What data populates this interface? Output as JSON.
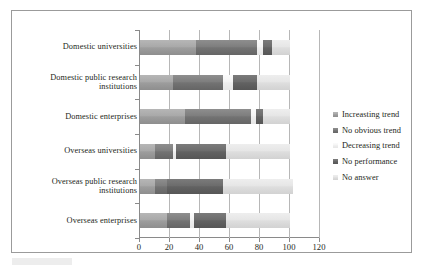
{
  "chart_data": {
    "type": "bar",
    "orientation": "horizontal",
    "stacked": true,
    "title": "",
    "xlabel": "",
    "ylabel": "",
    "xlim": [
      0,
      120
    ],
    "xticks": [
      0,
      20,
      40,
      60,
      80,
      100,
      120
    ],
    "grid": true,
    "legend_position": "right",
    "categories": [
      "Domestic universities",
      "Domestic public research institutions",
      "Domestic enterprises",
      "Overseas universities",
      "Overseas public research institutions",
      "Overseas enterprises"
    ],
    "series": [
      {
        "name": "Increasting trend",
        "color": "#a9a9a9",
        "values": [
          37,
          22,
          30,
          10,
          10,
          18
        ]
      },
      {
        "name": "No obvious trend",
        "color": "#7e7e7e",
        "values": [
          41,
          33,
          44,
          12,
          8,
          15
        ]
      },
      {
        "name": "Decreasing trend",
        "color": "#f4f4f4",
        "values": [
          4,
          7,
          3,
          2,
          0,
          3
        ]
      },
      {
        "name": "No performance",
        "color": "#6c6c6c",
        "values": [
          6,
          16,
          5,
          33,
          37,
          21
        ]
      },
      {
        "name": "No answer",
        "color": "#e6e6e6",
        "values": [
          12,
          22,
          18,
          43,
          47,
          43
        ]
      }
    ]
  },
  "legend": {
    "items": [
      {
        "label": "Increasting trend"
      },
      {
        "label": "No obvious trend"
      },
      {
        "label": "Decreasing trend"
      },
      {
        "label": "No performance"
      },
      {
        "label": "No answer"
      }
    ]
  },
  "axis": {
    "x_tick_labels": [
      "0",
      "20",
      "40",
      "60",
      "80",
      "100",
      "120"
    ]
  }
}
